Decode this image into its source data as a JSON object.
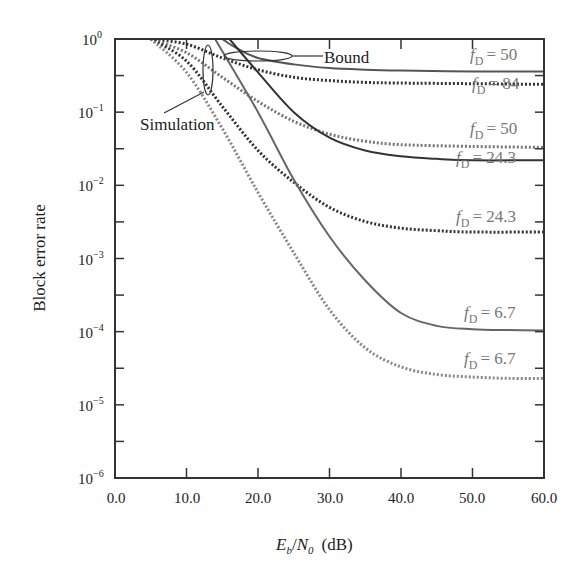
{
  "chart_data": {
    "type": "line",
    "title": "",
    "xlabel": "Eb/N0 (dB)",
    "xlabel_parts": {
      "E": "E",
      "b": "b",
      "slash": "/",
      "N": "N",
      "zero": "0",
      "unit": "(dB)"
    },
    "ylabel": "Block error rate",
    "xlim": [
      0,
      60
    ],
    "ylim": [
      1e-06,
      1
    ],
    "yscale": "log",
    "grid": false,
    "x_ticks": [
      "0.0",
      "10.0",
      "20.0",
      "30.0",
      "40.0",
      "50.0",
      "60.0"
    ],
    "y_ticks": [
      {
        "base": "10",
        "exp": "0"
      },
      {
        "base": "10",
        "exp": "−1"
      },
      {
        "base": "10",
        "exp": "−2"
      },
      {
        "base": "10",
        "exp": "−3"
      },
      {
        "base": "10",
        "exp": "−4"
      },
      {
        "base": "10",
        "exp": "−5"
      },
      {
        "base": "10",
        "exp": "−6"
      }
    ],
    "annotations": [
      {
        "text": "Bound",
        "target": "bound curves"
      },
      {
        "text": "Simulation",
        "target": "simulation curves"
      }
    ],
    "series": [
      {
        "name": "Bound fD = 50",
        "style": "solid",
        "color": "#555555",
        "x": [
          15,
          17,
          20,
          25,
          30,
          35,
          40,
          50,
          60
        ],
        "y": [
          1.0,
          0.75,
          0.55,
          0.45,
          0.4,
          0.38,
          0.37,
          0.36,
          0.36
        ]
      },
      {
        "name": "Simulation fD = 84",
        "style": "dotted",
        "color": "#333333",
        "x": [
          5,
          10,
          15,
          20,
          25,
          30,
          35,
          40,
          50,
          60
        ],
        "y": [
          1.0,
          0.85,
          0.55,
          0.38,
          0.3,
          0.27,
          0.255,
          0.25,
          0.245,
          0.24
        ]
      },
      {
        "name": "Simulation fD = 50",
        "style": "dotted",
        "color": "#777777",
        "x": [
          5,
          10,
          15,
          20,
          25,
          30,
          35,
          40,
          50,
          60
        ],
        "y": [
          1.0,
          0.65,
          0.3,
          0.14,
          0.075,
          0.05,
          0.04,
          0.036,
          0.034,
          0.033
        ]
      },
      {
        "name": "Bound fD = 24.3",
        "style": "solid",
        "color": "#333333",
        "x": [
          16,
          20,
          25,
          30,
          35,
          40,
          45,
          50,
          60
        ],
        "y": [
          1.0,
          0.35,
          0.1,
          0.045,
          0.03,
          0.025,
          0.023,
          0.022,
          0.022
        ]
      },
      {
        "name": "Simulation fD = 24.3",
        "style": "dotted",
        "color": "#333333",
        "x": [
          5,
          10,
          15,
          20,
          25,
          30,
          35,
          40,
          45,
          50,
          60
        ],
        "y": [
          1.0,
          0.5,
          0.12,
          0.03,
          0.011,
          0.005,
          0.0032,
          0.0026,
          0.0024,
          0.0023,
          0.0023
        ]
      },
      {
        "name": "Bound fD = 6.7",
        "style": "solid",
        "color": "#666666",
        "x": [
          14,
          20,
          25,
          30,
          35,
          40,
          45,
          50,
          55,
          60
        ],
        "y": [
          1.0,
          0.1,
          0.012,
          0.002,
          0.0005,
          0.00018,
          0.00012,
          0.000108,
          0.000105,
          0.000104
        ]
      },
      {
        "name": "Simulation fD = 6.7",
        "style": "dotted",
        "color": "#888888",
        "x": [
          5,
          10,
          15,
          20,
          25,
          30,
          35,
          40,
          45,
          50,
          55,
          60
        ],
        "y": [
          1.0,
          0.35,
          0.06,
          0.008,
          0.0012,
          0.0002,
          6e-05,
          3.3e-05,
          2.6e-05,
          2.4e-05,
          2.3e-05,
          2.3e-05
        ]
      }
    ],
    "curve_labels": [
      {
        "prefix": "f",
        "sub": "D",
        "value": "= 50",
        "for": "Bound fD = 50"
      },
      {
        "prefix": "f",
        "sub": "D",
        "value": "= 84",
        "for": "Simulation fD = 84"
      },
      {
        "prefix": "f",
        "sub": "D",
        "value": "= 50",
        "for": "Simulation fD = 50"
      },
      {
        "prefix": "f",
        "sub": "D",
        "value": "= 24.3",
        "for": "Bound fD = 24.3"
      },
      {
        "prefix": "f",
        "sub": "D",
        "value": "= 24.3",
        "for": "Simulation fD = 24.3"
      },
      {
        "prefix": "f",
        "sub": "D",
        "value": "= 6.7",
        "for": "Bound fD = 6.7"
      },
      {
        "prefix": "f",
        "sub": "D",
        "value": "= 6.7",
        "for": "Simulation fD = 6.7"
      }
    ]
  }
}
